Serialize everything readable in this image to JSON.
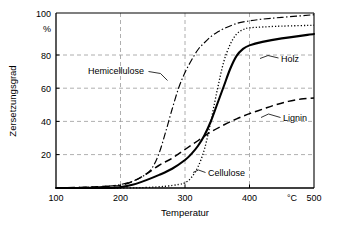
{
  "chart_data": {
    "type": "line",
    "title": "",
    "xlabel": "Temperatur",
    "ylabel": "Zersetzungsgrad",
    "x_unit": "°C",
    "y_unit": "%",
    "xlim": [
      100,
      500
    ],
    "ylim": [
      0,
      100
    ],
    "xticks": [
      "100",
      "200",
      "300",
      "400",
      "500"
    ],
    "yticks": [
      "20",
      "40",
      "60",
      "80",
      "100"
    ],
    "grid": true,
    "legend_position": "inline-annotations",
    "series": [
      {
        "name": "Hemicellulose",
        "style": "dash-dot",
        "label_x": 263,
        "label_y": 69,
        "x": [
          100,
          150,
          180,
          200,
          220,
          240,
          250,
          260,
          270,
          280,
          290,
          300,
          310,
          320,
          330,
          340,
          350,
          360,
          380,
          400,
          420,
          450,
          500
        ],
        "values": [
          0,
          0.5,
          1,
          2,
          4,
          8,
          12,
          20,
          32,
          45,
          57,
          66,
          73,
          79,
          83,
          86.5,
          89,
          91,
          94,
          95.5,
          96.5,
          97.5,
          99
        ]
      },
      {
        "name": "Cellulose",
        "style": "dotted",
        "label_x": 320,
        "label_y": 300,
        "x": [
          100,
          200,
          240,
          270,
          290,
          300,
          310,
          320,
          330,
          340,
          350,
          360,
          370,
          380,
          390,
          400,
          420,
          450,
          500
        ],
        "values": [
          0,
          0,
          0.3,
          1,
          2,
          3,
          6,
          12,
          22,
          38,
          56,
          72,
          82,
          88,
          90.5,
          91.5,
          92,
          92.5,
          93
        ]
      },
      {
        "name": "Holz",
        "style": "solid",
        "label_x": 430,
        "label_y": 84,
        "x": [
          100,
          180,
          200,
          220,
          240,
          260,
          280,
          300,
          310,
          320,
          330,
          340,
          350,
          360,
          370,
          380,
          390,
          400,
          420,
          450,
          500
        ],
        "values": [
          0,
          0,
          0.5,
          2,
          4.5,
          7.5,
          11,
          16,
          19.5,
          24,
          30,
          38,
          48,
          58,
          68,
          75.5,
          79.5,
          81.5,
          83.5,
          85.5,
          88
        ]
      },
      {
        "name": "Lignin",
        "style": "dashed",
        "label_x": 432,
        "label_y": 44,
        "x": [
          100,
          150,
          180,
          200,
          220,
          240,
          260,
          280,
          300,
          320,
          340,
          360,
          380,
          400,
          420,
          440,
          460,
          480,
          500
        ],
        "values": [
          0,
          0.5,
          1,
          1.5,
          4,
          8,
          13,
          17,
          22,
          27,
          32,
          36,
          39.5,
          42.5,
          45,
          47.5,
          49.5,
          50.8,
          51.5
        ]
      }
    ],
    "annotations": [
      {
        "text": "Hemicellulose",
        "leader": "to-hemicellulose-curve"
      },
      {
        "text": "Cellulose",
        "leader": "to-cellulose-curve"
      },
      {
        "text": "Holz",
        "leader": "to-holz-curve"
      },
      {
        "text": "Lignin",
        "leader": "to-lignin-curve"
      }
    ],
    "colors": {
      "axis": "#000000",
      "grid": "#9a9a9a",
      "curve": "#000000",
      "background": "#ffffff"
    }
  }
}
